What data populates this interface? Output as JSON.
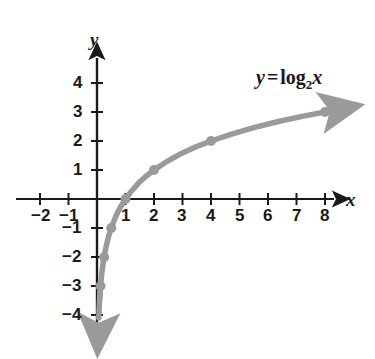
{
  "figure": {
    "background_color": "#ffffff",
    "curve_color": "#9a9a9a",
    "axis_color": "#1a1a1a",
    "width": 375,
    "height": 359
  },
  "axis_labels": {
    "x_name": "x",
    "y_name": "y"
  },
  "equation": {
    "lhs": "y",
    "operator": "=",
    "fn": "log",
    "base": "2",
    "arg": "x",
    "full_text": "y = log2 x"
  },
  "chart_data": {
    "type": "line",
    "title": "",
    "subtitle": "",
    "xlabel": "x",
    "ylabel": "y",
    "xlim": [
      -2.6,
      9.4
    ],
    "ylim": [
      -4.6,
      4.9
    ],
    "grid": false,
    "legend_position": "inside-top-right",
    "annotations": [
      {
        "text": "y = log2 x",
        "x": 6.1,
        "y": 3.9
      }
    ],
    "x_ticks": [
      -2,
      -1,
      1,
      2,
      3,
      4,
      5,
      6,
      7,
      8
    ],
    "x_tick_labels": [
      "−2",
      "−1",
      "1",
      "2",
      "3",
      "4",
      "5",
      "6",
      "7",
      "8"
    ],
    "y_ticks": [
      4,
      3,
      2,
      1,
      -1,
      -2,
      -3,
      -4
    ],
    "y_tick_labels": [
      "4",
      "3",
      "2",
      "1",
      "−1",
      "−2",
      "−3",
      "−4"
    ],
    "series": [
      {
        "name": "y = log2 x",
        "color": "#9a9a9a",
        "marked_points": [
          {
            "x": 0.125,
            "y": -3
          },
          {
            "x": 0.25,
            "y": -2
          },
          {
            "x": 0.5,
            "y": -1
          },
          {
            "x": 1,
            "y": 0
          },
          {
            "x": 2,
            "y": 1
          },
          {
            "x": 4,
            "y": 2
          },
          {
            "x": 8,
            "y": 3
          }
        ],
        "x": [
          0.09,
          0.11,
          0.125,
          0.15,
          0.18,
          0.21,
          0.25,
          0.3,
          0.36,
          0.42,
          0.5,
          0.6,
          0.72,
          0.85,
          1,
          1.2,
          1.45,
          1.7,
          2,
          2.4,
          2.9,
          3.4,
          4,
          4.7,
          5.5,
          6.4,
          7.2,
          8
        ],
        "y": [
          -3.47,
          -3.18,
          -3,
          -2.74,
          -2.47,
          -2.25,
          -2,
          -1.74,
          -1.47,
          -1.25,
          -1,
          -0.74,
          -0.47,
          -0.23,
          0,
          0.26,
          0.54,
          0.77,
          1,
          1.26,
          1.54,
          1.77,
          2,
          2.23,
          2.46,
          2.68,
          2.85,
          3
        ]
      }
    ]
  }
}
